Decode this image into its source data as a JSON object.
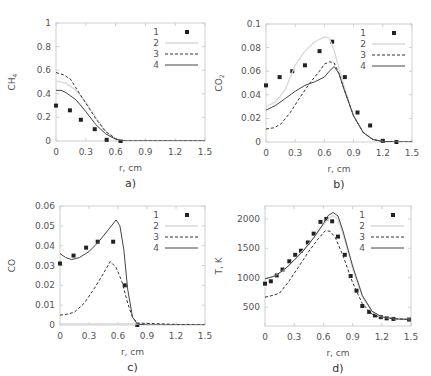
{
  "chart_data": [
    {
      "id": "a",
      "type": "line",
      "caption": "a)",
      "title": "",
      "xlabel": "r, cm",
      "ylabel": "CH4",
      "ylabel_main": "CH",
      "ylabel_sub": "4",
      "xlim": [
        0,
        1.5
      ],
      "ylim": [
        0,
        1
      ],
      "xticks": [
        "0",
        "0.3",
        "0.6",
        "0.9",
        "1.2",
        "1.5"
      ],
      "xtick_values": [
        0,
        0.3,
        0.6,
        0.9,
        1.2,
        1.5
      ],
      "yticks": [
        "0",
        "0.2",
        "0.4",
        "0.6",
        "0.8",
        "1"
      ],
      "ytick_values": [
        0,
        0.2,
        0.4,
        0.6,
        0.8,
        1
      ],
      "grid": false,
      "legend_position": "upper right",
      "legend": [
        "1",
        "2",
        "3",
        "4"
      ],
      "series": [
        {
          "name": "1",
          "style": "markers",
          "x": [
            0,
            0.14,
            0.25,
            0.39,
            0.51,
            0.65
          ],
          "y": [
            0.3,
            0.26,
            0.18,
            0.1,
            0.01,
            0.0
          ]
        },
        {
          "name": "2",
          "style": "light-line",
          "x": [
            0,
            0.1,
            0.2,
            0.3,
            0.4,
            0.5,
            0.6,
            0.7,
            0.9,
            1.2,
            1.5
          ],
          "y": [
            0.51,
            0.49,
            0.43,
            0.33,
            0.2,
            0.08,
            0.02,
            0.0,
            0.0,
            0.0,
            0.0
          ]
        },
        {
          "name": "3",
          "style": "dashed",
          "x": [
            0,
            0.08,
            0.15,
            0.2,
            0.3,
            0.4,
            0.5,
            0.6,
            0.65,
            0.7,
            0.9,
            1.2,
            1.5
          ],
          "y": [
            0.58,
            0.56,
            0.52,
            0.45,
            0.32,
            0.19,
            0.08,
            0.02,
            0.005,
            0.0,
            0.0,
            0.0,
            0.0
          ]
        },
        {
          "name": "4",
          "style": "solid",
          "x": [
            0,
            0.05,
            0.1,
            0.2,
            0.3,
            0.4,
            0.5,
            0.6,
            0.65,
            0.7,
            0.9,
            1.2,
            1.5
          ],
          "y": [
            0.43,
            0.43,
            0.41,
            0.35,
            0.25,
            0.14,
            0.06,
            0.015,
            0.005,
            0.0,
            0.0,
            0.0,
            0.0
          ]
        }
      ]
    },
    {
      "id": "b",
      "type": "line",
      "caption": "b)",
      "title": "",
      "xlabel": "r, cm",
      "ylabel": "CO2",
      "ylabel_main": "CO",
      "ylabel_sub": "2",
      "xlim": [
        0,
        1.5
      ],
      "ylim": [
        0,
        0.1
      ],
      "xticks": [
        "0",
        "0.3",
        "0.6",
        "0.9",
        "1.2",
        "1.5"
      ],
      "xtick_values": [
        0,
        0.3,
        0.6,
        0.9,
        1.2,
        1.5
      ],
      "yticks": [
        "0",
        "0.02",
        "0.04",
        "0.06",
        "0.08",
        "0.1"
      ],
      "ytick_values": [
        0,
        0.02,
        0.04,
        0.06,
        0.08,
        0.1
      ],
      "grid": false,
      "legend_position": "upper right",
      "legend": [
        "1",
        "2",
        "3",
        "4"
      ],
      "series": [
        {
          "name": "1",
          "style": "markers",
          "x": [
            0,
            0.14,
            0.27,
            0.4,
            0.55,
            0.68,
            0.81,
            0.94,
            1.07,
            1.2,
            1.34
          ],
          "y": [
            0.048,
            0.055,
            0.06,
            0.065,
            0.077,
            0.085,
            0.055,
            0.025,
            0.014,
            0.001,
            0.0
          ]
        },
        {
          "name": "2",
          "style": "light-line",
          "x": [
            0,
            0.1,
            0.2,
            0.3,
            0.4,
            0.5,
            0.6,
            0.65,
            0.7,
            0.75,
            0.8,
            0.9,
            1.0,
            1.1,
            1.2,
            1.35,
            1.5
          ],
          "y": [
            0.03,
            0.034,
            0.045,
            0.065,
            0.077,
            0.085,
            0.089,
            0.088,
            0.078,
            0.062,
            0.048,
            0.022,
            0.008,
            0.002,
            0.0005,
            0.0,
            0.0
          ]
        },
        {
          "name": "3",
          "style": "dashed",
          "x": [
            0,
            0.08,
            0.15,
            0.25,
            0.35,
            0.45,
            0.55,
            0.6,
            0.65,
            0.7,
            0.75,
            0.8,
            0.9,
            1.0,
            1.1,
            1.2,
            1.35,
            1.5
          ],
          "y": [
            0.011,
            0.012,
            0.015,
            0.025,
            0.038,
            0.05,
            0.06,
            0.066,
            0.068,
            0.067,
            0.058,
            0.045,
            0.022,
            0.008,
            0.002,
            0.0005,
            0.0,
            0.0
          ]
        },
        {
          "name": "4",
          "style": "solid",
          "x": [
            0,
            0.1,
            0.2,
            0.3,
            0.4,
            0.5,
            0.6,
            0.65,
            0.7,
            0.75,
            0.8,
            0.9,
            1.0,
            1.1,
            1.2,
            1.35,
            1.5
          ],
          "y": [
            0.027,
            0.031,
            0.037,
            0.043,
            0.048,
            0.051,
            0.055,
            0.06,
            0.064,
            0.058,
            0.045,
            0.022,
            0.008,
            0.002,
            0.0005,
            0.0,
            0.0
          ]
        }
      ]
    },
    {
      "id": "c",
      "type": "line",
      "caption": "c)",
      "title": "",
      "xlabel": "r, cm",
      "ylabel": "CO",
      "ylabel_main": "CO",
      "ylabel_sub": "",
      "xlim": [
        0,
        1.5
      ],
      "ylim": [
        0,
        0.06
      ],
      "xticks": [
        "0",
        "0.3",
        "0.6",
        "0.9",
        "1.2",
        "1.5"
      ],
      "xtick_values": [
        0,
        0.3,
        0.6,
        0.9,
        1.2,
        1.5
      ],
      "yticks": [
        "0",
        "0.01",
        "0.02",
        "0.03",
        "0.04",
        "0.05",
        "0.06"
      ],
      "ytick_values": [
        0,
        0.01,
        0.02,
        0.03,
        0.04,
        0.05,
        0.06
      ],
      "grid": false,
      "legend_position": "upper right",
      "legend": [
        "1",
        "2",
        "3",
        "4"
      ],
      "series": [
        {
          "name": "1",
          "style": "markers",
          "x": [
            0,
            0.14,
            0.27,
            0.39,
            0.55,
            0.67,
            0.8
          ],
          "y": [
            0.031,
            0.035,
            0.039,
            0.042,
            0.042,
            0.02,
            0.0
          ]
        },
        {
          "name": "2",
          "style": "light-line",
          "x": [
            0,
            0.3,
            0.6,
            0.79,
            0.8,
            1.0,
            1.2,
            1.5
          ],
          "y": [
            0.0005,
            0.0005,
            0.0005,
            0.0005,
            0.0005,
            0.0003,
            0.0001,
            0.0
          ]
        },
        {
          "name": "3",
          "style": "dashed",
          "x": [
            0,
            0.08,
            0.15,
            0.25,
            0.35,
            0.45,
            0.52,
            0.58,
            0.64,
            0.7,
            0.75,
            0.8,
            0.9,
            1.2,
            1.5
          ],
          "y": [
            0.005,
            0.0055,
            0.0065,
            0.011,
            0.018,
            0.026,
            0.032,
            0.029,
            0.022,
            0.011,
            0.004,
            0.001,
            0.0008,
            0.0003,
            0.0
          ]
        },
        {
          "name": "4",
          "style": "solid",
          "x": [
            0,
            0.06,
            0.12,
            0.2,
            0.3,
            0.4,
            0.5,
            0.58,
            0.62,
            0.66,
            0.7,
            0.75,
            0.8,
            0.9,
            1.2,
            1.5
          ],
          "y": [
            0.036,
            0.034,
            0.033,
            0.034,
            0.037,
            0.042,
            0.048,
            0.053,
            0.05,
            0.038,
            0.018,
            0.004,
            0.0005,
            0.0,
            0.0,
            0.0
          ]
        }
      ]
    },
    {
      "id": "d",
      "type": "line",
      "caption": "d)",
      "title": "",
      "xlabel": "r, cm",
      "ylabel": "T, K",
      "ylabel_main": "T, K",
      "ylabel_sub": "",
      "xlim": [
        0,
        1.5
      ],
      "ylim": [
        180,
        2220
      ],
      "xticks": [
        "0",
        "0.3",
        "0.6",
        "0.9",
        "1.2",
        "1.5"
      ],
      "xtick_values": [
        0,
        0.3,
        0.6,
        0.9,
        1.2,
        1.5
      ],
      "yticks": [
        "500",
        "1000",
        "1500",
        "2000"
      ],
      "ytick_values": [
        500,
        1000,
        1500,
        2000
      ],
      "grid": false,
      "legend_position": "upper right",
      "legend": [
        "1",
        "2",
        "3",
        "4"
      ],
      "series": [
        {
          "name": "1",
          "style": "markers",
          "x": [
            0,
            0.06,
            0.12,
            0.18,
            0.25,
            0.31,
            0.37,
            0.44,
            0.5,
            0.57,
            0.63,
            0.69,
            0.75,
            0.82,
            0.88,
            0.94,
            1.0,
            1.07,
            1.13,
            1.19,
            1.25,
            1.32,
            1.48
          ],
          "y": [
            900,
            940,
            1040,
            1140,
            1280,
            1390,
            1460,
            1600,
            1750,
            1950,
            2000,
            1960,
            1700,
            1390,
            1030,
            780,
            520,
            420,
            360,
            330,
            310,
            300,
            290
          ]
        },
        {
          "name": "2",
          "style": "light-line",
          "x": [
            0,
            0.1,
            0.2,
            0.3,
            0.4,
            0.5,
            0.6,
            0.65,
            0.7,
            0.75,
            0.8,
            0.9,
            1.0,
            1.1,
            1.2,
            1.35,
            1.5
          ],
          "y": [
            980,
            1030,
            1140,
            1300,
            1480,
            1680,
            1900,
            2000,
            2060,
            1990,
            1750,
            1150,
            680,
            420,
            330,
            300,
            290
          ]
        },
        {
          "name": "3",
          "style": "dashed",
          "x": [
            0,
            0.08,
            0.15,
            0.25,
            0.35,
            0.45,
            0.55,
            0.62,
            0.67,
            0.72,
            0.8,
            0.9,
            1.0,
            1.1,
            1.2,
            1.35,
            1.5
          ],
          "y": [
            670,
            700,
            740,
            950,
            1200,
            1450,
            1670,
            1800,
            1790,
            1690,
            1380,
            920,
            560,
            380,
            320,
            300,
            290
          ]
        },
        {
          "name": "4",
          "style": "solid",
          "x": [
            0,
            0.1,
            0.2,
            0.3,
            0.4,
            0.5,
            0.6,
            0.65,
            0.7,
            0.75,
            0.8,
            0.9,
            1.0,
            1.1,
            1.2,
            1.35,
            1.5
          ],
          "y": [
            980,
            1030,
            1140,
            1300,
            1470,
            1680,
            1920,
            2060,
            2110,
            2050,
            1800,
            1200,
            700,
            430,
            335,
            300,
            290
          ]
        }
      ]
    }
  ],
  "panels": [
    {
      "id": "a",
      "box": {
        "left": 56,
        "top": 23,
        "width": 149,
        "height": 118
      }
    },
    {
      "id": "b",
      "box": {
        "left": 266,
        "top": 24,
        "width": 146,
        "height": 118
      }
    },
    {
      "id": "c",
      "box": {
        "left": 60,
        "top": 206,
        "width": 145,
        "height": 119
      }
    },
    {
      "id": "d",
      "box": {
        "left": 265,
        "top": 206,
        "width": 146,
        "height": 120
      }
    }
  ],
  "colors": {
    "axis": "#d0d0d0",
    "tick_text": "#555555",
    "series_1": "#222222",
    "series_2": "#d8d8d8",
    "series_3": "#333333",
    "series_4": "#444444"
  }
}
